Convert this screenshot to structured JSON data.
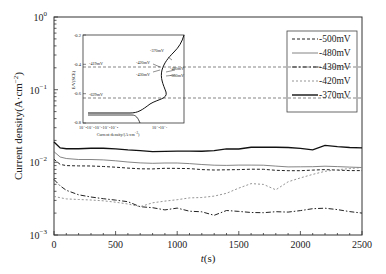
{
  "chart_data": {
    "type": "line",
    "title": "",
    "xlabel": "t(s)",
    "ylabel": "Current density(A·cm⁻²)",
    "xscale": "linear",
    "yscale": "log",
    "xlim": [
      0,
      2500
    ],
    "ylim": [
      0.001,
      1
    ],
    "x_ticks": [
      "0",
      "500",
      "1000",
      "1500",
      "2000",
      "2500"
    ],
    "y_ticks": [
      "10^-3",
      "10^-2",
      "10^-1",
      "10^0"
    ],
    "grid": false,
    "legend_position": "upper right",
    "x": [
      0,
      50,
      100,
      200,
      300,
      400,
      500,
      600,
      700,
      800,
      900,
      1000,
      1100,
      1200,
      1300,
      1400,
      1500,
      1600,
      1700,
      1800,
      1900,
      2000,
      2100,
      2200,
      2300,
      2400,
      2500
    ],
    "series": [
      {
        "name": "-500mV",
        "style": "dashed",
        "color": "#222222",
        "values": [
          0.011,
          0.0095,
          0.0092,
          0.009,
          0.0088,
          0.0086,
          0.0085,
          0.0084,
          0.0083,
          0.0082,
          0.0082,
          0.0081,
          0.0081,
          0.008,
          0.008,
          0.008,
          0.0079,
          0.0079,
          0.0079,
          0.0078,
          0.0078,
          0.0078,
          0.0078,
          0.0078,
          0.0077,
          0.0077,
          0.0077
        ]
      },
      {
        "name": "-480mV",
        "style": "solid-thin",
        "color": "#666666",
        "values": [
          0.014,
          0.012,
          0.0115,
          0.011,
          0.0108,
          0.0106,
          0.0104,
          0.0102,
          0.01,
          0.0098,
          0.0097,
          0.0096,
          0.0095,
          0.0094,
          0.0093,
          0.0092,
          0.0091,
          0.009,
          0.009,
          0.0089,
          0.0088,
          0.0088,
          0.0087,
          0.0087,
          0.0086,
          0.0086,
          0.0085
        ]
      },
      {
        "name": "-430mV",
        "style": "dash-dot",
        "color": "#222222",
        "values": [
          0.0058,
          0.0048,
          0.0042,
          0.0036,
          0.0033,
          0.0031,
          0.003,
          0.0029,
          0.0025,
          0.0024,
          0.0022,
          0.0023,
          0.0021,
          0.0021,
          0.0019,
          0.0022,
          0.0021,
          0.002,
          0.002,
          0.0021,
          0.0021,
          0.0022,
          0.0023,
          0.0023,
          0.0022,
          0.0021,
          0.002
        ]
      },
      {
        "name": "-420mV",
        "style": "dotted-gray",
        "color": "#888888",
        "values": [
          0.0034,
          0.0033,
          0.0032,
          0.0031,
          0.003,
          0.0029,
          0.0028,
          0.0027,
          0.0025,
          0.0028,
          0.0029,
          0.003,
          0.0032,
          0.0033,
          0.0035,
          0.0038,
          0.0044,
          0.005,
          0.0049,
          0.0042,
          0.0055,
          0.0062,
          0.0068,
          0.0074,
          0.0078,
          0.0082,
          0.0085
        ]
      },
      {
        "name": "-370mV",
        "style": "solid-thick",
        "color": "#111111",
        "values": [
          0.019,
          0.016,
          0.0157,
          0.0155,
          0.0154,
          0.0153,
          0.0152,
          0.015,
          0.0148,
          0.0142,
          0.014,
          0.014,
          0.0141,
          0.0143,
          0.0148,
          0.0155,
          0.0152,
          0.0158,
          0.016,
          0.0162,
          0.0163,
          0.0158,
          0.0148,
          0.0168,
          0.0162,
          0.016,
          0.0158
        ]
      }
    ],
    "inset": {
      "type": "line",
      "xlabel": "Current density/(A·cm⁻²)",
      "ylabel": "E/V(SCE)",
      "ylim": [
        -0.8,
        -0.2
      ],
      "y_ticks": [
        "-0.2",
        "-0.4",
        "-0.6",
        "-0.8"
      ],
      "x_ticks": [
        "10⁻⁸ 10⁻⁷10⁻⁶10⁻⁵ 10⁻⁴",
        "10⁻² 10⁻¹"
      ],
      "hlines": [
        {
          "label": "-419mV",
          "y": -0.419
        },
        {
          "label": "-629mV",
          "y": -0.629
        }
      ],
      "annotations": [
        "-370mV",
        "-420mV",
        "-430mV",
        "-480mV",
        "-500mV"
      ]
    }
  },
  "axes": {
    "xlabel_italic": "t",
    "xlabel_unit": "(s)",
    "ylabel": "Current density(A·cm",
    "ylabel_sup": "−2",
    "ylabel_close": ")",
    "x_ticks": [
      "0",
      "500",
      "1000",
      "1500",
      "2000",
      "2500"
    ],
    "y_tick_base": "10",
    "y_tick_exps": [
      "0",
      "−1",
      "−2",
      "−3"
    ]
  },
  "legend": {
    "items": [
      "-500mV",
      "-480mV",
      "-430mV",
      "-420mV",
      "-370mV"
    ]
  },
  "inset": {
    "ylabel": "E/V(SCE)",
    "xlabel": "Current density/(A·cm",
    "xlabel_sup": "−2",
    "xlabel_close": ")",
    "y_ticks": [
      "-0.2",
      "-0.4",
      "-0.6",
      "-0.8"
    ],
    "x_ticks_left": "10⁻⁸10⁻⁷10⁻⁶10⁻⁵10⁻⁴",
    "x_ticks_right": "10⁻²10⁻¹",
    "hline_labels": [
      "-419mV",
      "-629mV"
    ],
    "arrow_labels": [
      "-370mV",
      "-420mV",
      "-430mV",
      "-480mV",
      "-500mV"
    ]
  }
}
